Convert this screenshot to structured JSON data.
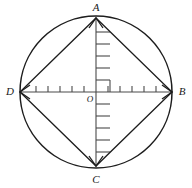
{
  "figure": {
    "background_color": "#ffffff",
    "stroke_color": "#1d1d1d",
    "axis_color": "#4a4a4a",
    "vertices": [
      {
        "id": "A",
        "label": "A",
        "position": "top",
        "cx": 96,
        "cy": 18,
        "label_x": 96,
        "label_y": 11
      },
      {
        "id": "B",
        "label": "B",
        "position": "right",
        "cx": 172,
        "cy": 92,
        "label_x": 182,
        "label_y": 95
      },
      {
        "id": "C",
        "label": "C",
        "position": "bottom",
        "cx": 96,
        "cy": 166,
        "label_x": 96,
        "label_y": 182
      },
      {
        "id": "D",
        "label": "D",
        "position": "left",
        "cx": 20,
        "cy": 92,
        "label_x": 10,
        "label_y": 95
      }
    ],
    "origin": {
      "label": "O",
      "cx": 96,
      "cy": 92,
      "label_x": 90,
      "label_y": 101
    },
    "circle": {
      "cx": 96,
      "cy": 92,
      "r": 76
    },
    "axes": {
      "horizontal": {
        "x1": 20,
        "y1": 92,
        "x2": 172,
        "y2": 92
      },
      "vertical": {
        "x1": 96,
        "y1": 18,
        "x2": 96,
        "y2": 166
      }
    },
    "ruler": {
      "tick_spacing": 12,
      "horizontal_tick_length": 6,
      "vertical_tick_length": 14,
      "horizontal_left_ticks": [
        84,
        72,
        60,
        48,
        36
      ],
      "horizontal_right_ticks": [
        108,
        120,
        132,
        144,
        156
      ],
      "vertical_up_ticks": [
        80,
        68,
        56,
        44,
        32
      ],
      "vertical_down_ticks": [
        104,
        116,
        128,
        140,
        152
      ]
    },
    "edges": [
      {
        "from": "A",
        "to": "B"
      },
      {
        "from": "B",
        "to": "C"
      },
      {
        "from": "C",
        "to": "D"
      },
      {
        "from": "D",
        "to": "A"
      }
    ]
  }
}
